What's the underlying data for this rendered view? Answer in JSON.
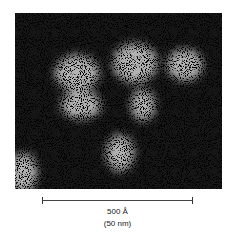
{
  "figure": {
    "type": "electron micrograph",
    "colors": {
      "background": "#ffffff",
      "image_dark": "#111111",
      "image_light": "#eeeeee",
      "text": "#222222"
    }
  },
  "scale_bar": {
    "primary_label": "500 Å",
    "secondary_label": "(50 nm)"
  }
}
